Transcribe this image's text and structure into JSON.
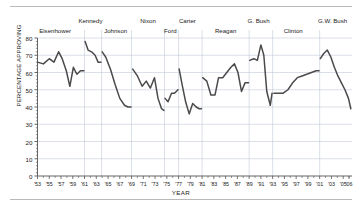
{
  "figure": {
    "ylabel": "PERCENTAGE APPROVING",
    "xlabel": "YEAR",
    "line_color": "#4a4a4a",
    "grid_color": "#c3c9d6",
    "axis_color": "#555555",
    "rule_color": "#b9b9b9"
  },
  "chart_data": {
    "type": "line",
    "title": "",
    "xlabel": "YEAR",
    "ylabel": "PERCENTAGE APPROVING",
    "xlim": [
      1953,
      2006.5
    ],
    "ylim": [
      0,
      80
    ],
    "yticks": [
      0,
      10,
      20,
      30,
      40,
      50,
      60,
      70,
      80
    ],
    "xtick_labels": [
      "'53",
      "'55",
      "'57",
      "'59",
      "'61",
      "'63",
      "'65",
      "'67",
      "'69",
      "'71",
      "'73",
      "'75",
      "'77",
      "'79",
      "'81",
      "'83",
      "'85",
      "'87",
      "'89",
      "'91",
      "'93",
      "'95",
      "'97",
      "'99",
      "'01",
      "'03",
      "'05",
      "'06"
    ],
    "xtick_values": [
      1953,
      1955,
      1957,
      1959,
      1961,
      1963,
      1965,
      1967,
      1969,
      1971,
      1973,
      1975,
      1977,
      1979,
      1981,
      1983,
      1985,
      1987,
      1989,
      1991,
      1993,
      1995,
      1997,
      1999,
      2001,
      2003,
      2005,
      2006
    ],
    "grid": true,
    "legend": "none",
    "annotations": [
      {
        "label": "Eisenhower",
        "x": 1956.0
      },
      {
        "label": "Kennedy",
        "x": 1962.0
      },
      {
        "label": "Johnson",
        "x": 1966.3
      },
      {
        "label": "Nixon",
        "x": 1971.8
      },
      {
        "label": "Ford",
        "x": 1975.6
      },
      {
        "label": "Carter",
        "x": 1978.5
      },
      {
        "label": "Reagan",
        "x": 1985.0
      },
      {
        "label": "G. Bush",
        "x": 1990.6
      },
      {
        "label": "Clinton",
        "x": 1996.5
      },
      {
        "label": "G.W. Bush",
        "x": 2003.2
      }
    ],
    "president_boundaries": [
      1961.0,
      1963.9,
      1969.0,
      1974.6,
      1977.0,
      1981.0,
      1989.0,
      1993.0,
      2001.0
    ],
    "series": [
      {
        "name": "Presidential approval",
        "segments": [
          {
            "president": "Eisenhower",
            "x": [
              1953.0,
              1954.0,
              1955.0,
              1955.8,
              1956.6,
              1957.2,
              1957.9,
              1958.5,
              1959.1,
              1959.7,
              1960.3,
              1960.9
            ],
            "y": [
              66,
              65,
              68,
              66,
              72,
              68,
              61,
              52,
              63,
              59,
              61,
              61
            ]
          },
          {
            "president": "Kennedy",
            "x": [
              1961.1,
              1961.6,
              1962.2,
              1962.8,
              1963.3,
              1963.8
            ],
            "y": [
              78,
              73,
              72,
              70,
              66,
              66
            ]
          },
          {
            "president": "Johnson",
            "x": [
              1964.0,
              1964.6,
              1965.4,
              1966.2,
              1967.0,
              1967.8,
              1968.4,
              1968.9
            ],
            "y": [
              72,
              69,
              62,
              53,
              45,
              41,
              40,
              40
            ]
          },
          {
            "president": "Nixon",
            "x": [
              1969.2,
              1970.0,
              1970.8,
              1971.5,
              1972.2,
              1972.9,
              1973.5,
              1974.1,
              1974.5
            ],
            "y": [
              62,
              58,
              52,
              55,
              51,
              57,
              45,
              39,
              38
            ]
          },
          {
            "president": "Ford",
            "x": [
              1974.7,
              1975.2,
              1975.8,
              1976.3,
              1976.9
            ],
            "y": [
              45,
              43,
              48,
              48,
              50
            ]
          },
          {
            "president": "Carter",
            "x": [
              1977.1,
              1977.6,
              1978.2,
              1978.8,
              1979.4,
              1980.0,
              1980.5,
              1980.9
            ],
            "y": [
              62,
              53,
              43,
              36,
              42,
              40,
              39,
              39
            ]
          },
          {
            "president": "Reagan",
            "x": [
              1981.1,
              1981.8,
              1982.5,
              1983.2,
              1983.8,
              1984.5,
              1985.2,
              1985.9,
              1986.5,
              1987.1,
              1987.7,
              1988.3,
              1988.9
            ],
            "y": [
              57,
              55,
              47,
              47,
              57,
              57,
              60,
              63,
              65,
              60,
              49,
              54,
              54
            ]
          },
          {
            "president": "G. Bush",
            "x": [
              1989.1,
              1989.8,
              1990.4,
              1991.0,
              1991.5,
              1992.0,
              1992.6,
              1992.9
            ],
            "y": [
              67,
              68,
              67,
              76,
              70,
              49,
              41,
              48
            ]
          },
          {
            "president": "Clinton",
            "x": [
              1993.2,
              1994.0,
              1994.8,
              1995.6,
              1996.4,
              1997.2,
              1998.0,
              1998.8,
              1999.6,
              2000.4,
              2000.9
            ],
            "y": [
              48,
              48,
              48,
              50,
              54,
              57,
              58,
              59,
              60,
              61,
              61
            ]
          },
          {
            "president": "G.W. Bush",
            "x": [
              2001.1,
              2001.7,
              2002.3,
              2002.9,
              2003.5,
              2004.1,
              2004.7,
              2005.3,
              2005.9,
              2006.3
            ],
            "y": [
              68,
              71,
              73,
              69,
              63,
              58,
              54,
              50,
              45,
              39
            ]
          }
        ]
      }
    ]
  }
}
